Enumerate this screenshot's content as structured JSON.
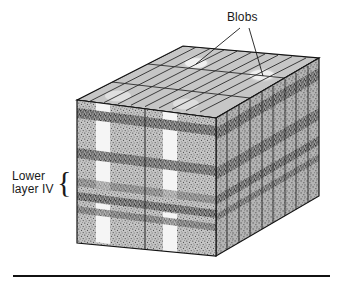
{
  "figure": {
    "kind": "scientific-illustration",
    "background_color": "#ffffff",
    "width": 343,
    "height": 286
  },
  "labels": {
    "blobs": "Blobs",
    "layer_line1": "Lower",
    "layer_line2": "layer IV",
    "brace_glyph": "{"
  },
  "colors": {
    "ink": "#1a1a1a",
    "top_face": "#b5b5b5",
    "top_face_light": "#c9c9c9",
    "blob_highlight": "#f2f2f2",
    "front_face": "#bdbdbd",
    "side_face": "#a8a8a8",
    "band_dark": "#6e6e6e",
    "stripe_light": "#f4f4f4",
    "rule": "#111111"
  },
  "geometry": {
    "front_top_left": [
      77,
      100
    ],
    "front_top_right": [
      216,
      118
    ],
    "front_bottom_left": [
      77,
      243
    ],
    "front_bottom_right": [
      216,
      256
    ],
    "back_top_left": [
      183,
      46
    ],
    "back_top_right": [
      319,
      58
    ],
    "back_bottom_right": [
      319,
      196
    ],
    "depth_dx": 104,
    "depth_dy": -56,
    "top_grid_columns": 10,
    "top_grid_rows": 3,
    "side_columns": 9,
    "front_panels": 2
  },
  "bands": {
    "count": 4,
    "description": "horizontal darker stippled laminae across front and side faces",
    "front_y_fractions": [
      0.08,
      0.4,
      0.62,
      0.76
    ]
  },
  "stripes": {
    "count": 4,
    "description": "vertical pale blob columns on front face, interrupted mid-depth"
  },
  "blob_spots": [
    {
      "cx": 196,
      "cy": 63,
      "rx": 13,
      "ry": 6
    },
    {
      "cx": 262,
      "cy": 75,
      "rx": 14,
      "ry": 6
    }
  ],
  "leader_lines": [
    {
      "from": [
        240,
        28
      ],
      "to": [
        196,
        64
      ]
    },
    {
      "from": [
        249,
        28
      ],
      "to": [
        263,
        76
      ]
    }
  ],
  "rule": {
    "x1": 13,
    "x2": 330,
    "y": 276,
    "thickness": 2
  }
}
